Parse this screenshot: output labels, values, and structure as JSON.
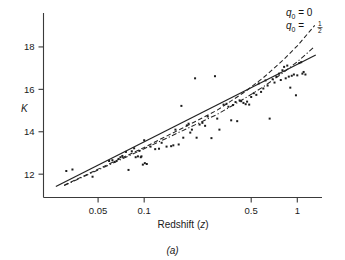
{
  "figure": {
    "caption": "(a)",
    "background": "#ffffff",
    "ink_color": "#222222"
  },
  "chart_data": {
    "type": "scatter",
    "title": "",
    "subtitle": "",
    "xlabel": "Redshift (z)",
    "ylabel": "K",
    "xscale": "log",
    "yscale": "linear",
    "grid": false,
    "legend_position": "top-right",
    "xlim": [
      0.022,
      1.45
    ],
    "ylim": [
      10.9,
      19.6
    ],
    "xticks": [
      0.05,
      0.1,
      0.5,
      1
    ],
    "xtick_labels": [
      "0.05",
      "0.1",
      "0.5",
      "1"
    ],
    "yticks": [
      12,
      14,
      16,
      18
    ],
    "ytick_labels": [
      "12",
      "14",
      "16",
      "18"
    ],
    "annotations": [
      {
        "text": "q0 = 0",
        "label_html": "q<sub>0</sub> = 0",
        "x": 1.28,
        "y": 19.35
      },
      {
        "text": "q0 = 1/2",
        "label_html": "q<sub>0</sub> = ½",
        "x": 1.28,
        "y": 18.75
      }
    ],
    "series": [
      {
        "name": "K-band galaxies",
        "type": "scatter",
        "marker": "square",
        "marker_size": 2,
        "color": "#1c1c1c",
        "points": [
          [
            0.031,
            12.15
          ],
          [
            0.034,
            12.22
          ],
          [
            0.046,
            11.88
          ],
          [
            0.059,
            12.62
          ],
          [
            0.062,
            12.66
          ],
          [
            0.064,
            12.58
          ],
          [
            0.068,
            12.72
          ],
          [
            0.07,
            12.8
          ],
          [
            0.072,
            12.86
          ],
          [
            0.076,
            13.05
          ],
          [
            0.079,
            12.2
          ],
          [
            0.083,
            13.08
          ],
          [
            0.086,
            13.22
          ],
          [
            0.088,
            12.8
          ],
          [
            0.091,
            12.84
          ],
          [
            0.093,
            13.1
          ],
          [
            0.095,
            12.8
          ],
          [
            0.096,
            12.84
          ],
          [
            0.098,
            12.45
          ],
          [
            0.1,
            13.6
          ],
          [
            0.101,
            12.52
          ],
          [
            0.104,
            12.48
          ],
          [
            0.11,
            13.3
          ],
          [
            0.118,
            13.18
          ],
          [
            0.125,
            13.2
          ],
          [
            0.13,
            13.48
          ],
          [
            0.14,
            13.3
          ],
          [
            0.15,
            13.32
          ],
          [
            0.155,
            13.36
          ],
          [
            0.16,
            14.1
          ],
          [
            0.168,
            13.4
          ],
          [
            0.175,
            15.22
          ],
          [
            0.18,
            13.72
          ],
          [
            0.19,
            14.3
          ],
          [
            0.195,
            14.38
          ],
          [
            0.2,
            13.96
          ],
          [
            0.205,
            14.1
          ],
          [
            0.215,
            16.52
          ],
          [
            0.22,
            13.72
          ],
          [
            0.23,
            14.34
          ],
          [
            0.24,
            14.42
          ],
          [
            0.25,
            14.28
          ],
          [
            0.26,
            14.72
          ],
          [
            0.275,
            13.7
          ],
          [
            0.29,
            16.62
          ],
          [
            0.3,
            14.62
          ],
          [
            0.31,
            14.1
          ],
          [
            0.33,
            15.28
          ],
          [
            0.345,
            15.32
          ],
          [
            0.355,
            15.18
          ],
          [
            0.37,
            14.54
          ],
          [
            0.38,
            15.26
          ],
          [
            0.395,
            15.4
          ],
          [
            0.405,
            14.5
          ],
          [
            0.42,
            15.48
          ],
          [
            0.43,
            15.44
          ],
          [
            0.445,
            15.36
          ],
          [
            0.46,
            15.3
          ],
          [
            0.47,
            15.42
          ],
          [
            0.485,
            15.28
          ],
          [
            0.5,
            15.64
          ],
          [
            0.52,
            15.82
          ],
          [
            0.54,
            15.74
          ],
          [
            0.56,
            16.28
          ],
          [
            0.58,
            15.88
          ],
          [
            0.6,
            16.04
          ],
          [
            0.62,
            16.42
          ],
          [
            0.64,
            16.18
          ],
          [
            0.66,
            14.62
          ],
          [
            0.69,
            16.48
          ],
          [
            0.71,
            16.32
          ],
          [
            0.73,
            16.6
          ],
          [
            0.76,
            16.74
          ],
          [
            0.78,
            16.44
          ],
          [
            0.8,
            16.9
          ],
          [
            0.82,
            17.06
          ],
          [
            0.84,
            16.52
          ],
          [
            0.86,
            17.12
          ],
          [
            0.88,
            16.6
          ],
          [
            0.9,
            16.08
          ],
          [
            0.92,
            16.64
          ],
          [
            0.95,
            16.7
          ],
          [
            0.98,
            15.72
          ],
          [
            1.0,
            16.66
          ],
          [
            1.03,
            17.24
          ],
          [
            1.06,
            17.28
          ],
          [
            1.08,
            16.74
          ],
          [
            1.1,
            16.82
          ],
          [
            1.13,
            16.7
          ]
        ]
      },
      {
        "name": "linear fit",
        "type": "line",
        "style": "solid",
        "color": "#222222",
        "x": [
          0.0265,
          1.32
        ],
        "y": [
          11.42,
          17.62
        ]
      },
      {
        "name": "q0 = 0",
        "type": "line",
        "style": "dashed",
        "color": "#222222",
        "x": [
          0.03,
          0.1,
          0.2,
          0.3,
          0.45,
          0.6,
          0.8,
          1.0,
          1.2,
          1.3
        ],
        "y": [
          11.48,
          13.26,
          14.36,
          15.02,
          15.86,
          16.55,
          17.35,
          18.05,
          18.72,
          19.02
        ]
      },
      {
        "name": "q0 = 1/2",
        "type": "line",
        "style": "dashdot",
        "color": "#222222",
        "x": [
          0.03,
          0.1,
          0.2,
          0.3,
          0.45,
          0.6,
          0.8,
          1.0,
          1.2,
          1.3
        ],
        "y": [
          11.46,
          13.2,
          14.22,
          14.82,
          15.56,
          16.12,
          16.76,
          17.3,
          17.8,
          18.03
        ]
      }
    ]
  }
}
